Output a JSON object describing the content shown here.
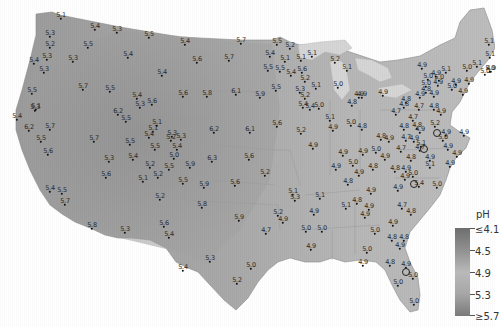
{
  "map": {
    "subject": "Precipitation pH across the contiguous United States",
    "colors": {
      "acid_low": "#6e6e6e",
      "mid": "#b9b9b9",
      "high": "#7a7a7a",
      "water": "#d0d0d0",
      "background": "#ffffff"
    }
  },
  "legend": {
    "title": "pH",
    "labels": [
      "≤4.1",
      "4.5",
      "4.9",
      "5.3",
      "≥5.7"
    ]
  },
  "stations": [
    {
      "v": "5.1",
      "x": 61,
      "y": 19
    },
    {
      "v": "5.4",
      "x": 95,
      "y": 30
    },
    {
      "v": "5.3",
      "x": 117,
      "y": 33
    },
    {
      "v": "5.5",
      "x": 149,
      "y": 38
    },
    {
      "v": "5.3",
      "x": 50,
      "y": 37
    },
    {
      "v": "5.2",
      "x": 50,
      "y": 48
    },
    {
      "v": "5.5",
      "x": 88,
      "y": 48
    },
    {
      "v": "5.3",
      "x": 47,
      "y": 60
    },
    {
      "v": "5.4",
      "x": 34,
      "y": 64
    },
    {
      "v": "5.3",
      "x": 73,
      "y": 62
    },
    {
      "v": "5.4",
      "x": 128,
      "y": 58
    },
    {
      "v": "5.3",
      "x": 44,
      "y": 73
    },
    {
      "v": "5.5",
      "x": 32,
      "y": 94
    },
    {
      "v": "5.7",
      "x": 83,
      "y": 90
    },
    {
      "v": "5.5",
      "x": 110,
      "y": 92
    },
    {
      "v": "5.1",
      "x": 36,
      "y": 110
    },
    {
      "v": "5.3",
      "x": 35,
      "y": 111
    },
    {
      "v": "5.4",
      "x": 137,
      "y": 99
    },
    {
      "v": "5.3",
      "x": 140,
      "y": 108
    },
    {
      "v": "5.6",
      "x": 152,
      "y": 105
    },
    {
      "v": "5.4",
      "x": 185,
      "y": 45
    },
    {
      "v": "5.7",
      "x": 241,
      "y": 44
    },
    {
      "v": "5.6",
      "x": 197,
      "y": 63
    },
    {
      "v": "5.7",
      "x": 229,
      "y": 61
    },
    {
      "v": "5.4",
      "x": 162,
      "y": 76
    },
    {
      "v": "5.6",
      "x": 183,
      "y": 97
    },
    {
      "v": "5.8",
      "x": 207,
      "y": 97
    },
    {
      "v": "6.1",
      "x": 236,
      "y": 95
    },
    {
      "v": "5.9",
      "x": 260,
      "y": 98
    },
    {
      "v": "5.5",
      "x": 277,
      "y": 45
    },
    {
      "v": "5.2",
      "x": 290,
      "y": 49
    },
    {
      "v": "5.4",
      "x": 270,
      "y": 57
    },
    {
      "v": "5.1",
      "x": 285,
      "y": 62
    },
    {
      "v": "5.1",
      "x": 301,
      "y": 61
    },
    {
      "v": "5.5",
      "x": 268,
      "y": 71
    },
    {
      "v": "5.5",
      "x": 280,
      "y": 72
    },
    {
      "v": "5.4",
      "x": 291,
      "y": 76
    },
    {
      "v": "5.5",
      "x": 276,
      "y": 91
    },
    {
      "v": "5.6",
      "x": 302,
      "y": 73
    },
    {
      "v": "5.2",
      "x": 305,
      "y": 82
    },
    {
      "v": "5.3",
      "x": 300,
      "y": 93
    },
    {
      "v": "5.2",
      "x": 305,
      "y": 99
    },
    {
      "v": "5.4",
      "x": 303,
      "y": 108
    },
    {
      "v": "5.1",
      "x": 312,
      "y": 57
    },
    {
      "v": "5.2",
      "x": 335,
      "y": 63
    },
    {
      "v": "5.1",
      "x": 347,
      "y": 71
    },
    {
      "v": "5.1",
      "x": 316,
      "y": 89
    },
    {
      "v": "5.0",
      "x": 338,
      "y": 88
    },
    {
      "v": "4.9",
      "x": 359,
      "y": 98
    },
    {
      "v": "5.4",
      "x": 17,
      "y": 120
    },
    {
      "v": "6.2",
      "x": 29,
      "y": 131
    },
    {
      "v": "5.7",
      "x": 50,
      "y": 130
    },
    {
      "v": "5.5",
      "x": 41,
      "y": 142
    },
    {
      "v": "5.6",
      "x": 48,
      "y": 155
    },
    {
      "v": "6.2",
      "x": 118,
      "y": 115
    },
    {
      "v": "5.5",
      "x": 126,
      "y": 122
    },
    {
      "v": "5.7",
      "x": 94,
      "y": 142
    },
    {
      "v": "5.5",
      "x": 130,
      "y": 145
    },
    {
      "v": "5.4",
      "x": 133,
      "y": 160
    },
    {
      "v": "5.3",
      "x": 109,
      "y": 162
    },
    {
      "v": "5.6",
      "x": 106,
      "y": 178
    },
    {
      "v": "5.2",
      "x": 150,
      "y": 168
    },
    {
      "v": "5.1",
      "x": 143,
      "y": 182
    },
    {
      "v": "5.1",
      "x": 153,
      "y": 132
    },
    {
      "v": "5.3",
      "x": 172,
      "y": 137
    },
    {
      "v": "5.1",
      "x": 157,
      "y": 126
    },
    {
      "v": "5.2",
      "x": 171,
      "y": 141
    },
    {
      "v": "5.3",
      "x": 181,
      "y": 140
    },
    {
      "v": "5.4",
      "x": 149,
      "y": 138
    },
    {
      "v": "5.5",
      "x": 155,
      "y": 150
    },
    {
      "v": "5.4",
      "x": 177,
      "y": 150
    },
    {
      "v": "5.0",
      "x": 174,
      "y": 159
    },
    {
      "v": "5.9",
      "x": 190,
      "y": 168
    },
    {
      "v": "5.5",
      "x": 169,
      "y": 170
    },
    {
      "v": "5.2",
      "x": 158,
      "y": 178
    },
    {
      "v": "5.5",
      "x": 183,
      "y": 184
    },
    {
      "v": "5.9",
      "x": 204,
      "y": 188
    },
    {
      "v": "6.2",
      "x": 214,
      "y": 133
    },
    {
      "v": "6.1",
      "x": 250,
      "y": 133
    },
    {
      "v": "5.6",
      "x": 277,
      "y": 127
    },
    {
      "v": "6.3",
      "x": 212,
      "y": 162
    },
    {
      "v": "5.6",
      "x": 249,
      "y": 160
    },
    {
      "v": "5.6",
      "x": 235,
      "y": 186
    },
    {
      "v": "5.2",
      "x": 265,
      "y": 176
    },
    {
      "v": "5.1",
      "x": 293,
      "y": 195
    },
    {
      "v": "5.3",
      "x": 295,
      "y": 201
    },
    {
      "v": "5.2",
      "x": 160,
      "y": 200
    },
    {
      "v": "5.8",
      "x": 202,
      "y": 208
    },
    {
      "v": "5.6",
      "x": 164,
      "y": 227
    },
    {
      "v": "5.4",
      "x": 169,
      "y": 238
    },
    {
      "v": "5.9",
      "x": 239,
      "y": 221
    },
    {
      "v": "5.4",
      "x": 50,
      "y": 192
    },
    {
      "v": "5.5",
      "x": 62,
      "y": 194
    },
    {
      "v": "5.7",
      "x": 65,
      "y": 205
    },
    {
      "v": "5.8",
      "x": 92,
      "y": 229
    },
    {
      "v": "5.3",
      "x": 125,
      "y": 233
    },
    {
      "v": "5.2",
      "x": 278,
      "y": 216
    },
    {
      "v": "4.9",
      "x": 283,
      "y": 223
    },
    {
      "v": "4.7",
      "x": 266,
      "y": 234
    },
    {
      "v": "5.3",
      "x": 210,
      "y": 262
    },
    {
      "v": "5.4",
      "x": 183,
      "y": 271
    },
    {
      "v": "5.0",
      "x": 251,
      "y": 269
    },
    {
      "v": "5.2",
      "x": 237,
      "y": 284
    },
    {
      "v": "4.9",
      "x": 362,
      "y": 98
    },
    {
      "v": "4.8",
      "x": 352,
      "y": 106
    },
    {
      "v": "5.4",
      "x": 310,
      "y": 110
    },
    {
      "v": "5.0",
      "x": 319,
      "y": 109
    },
    {
      "v": "5.1",
      "x": 330,
      "y": 121
    },
    {
      "v": "4.9",
      "x": 333,
      "y": 131
    },
    {
      "v": "5.2",
      "x": 301,
      "y": 134
    },
    {
      "v": "4.9",
      "x": 313,
      "y": 149
    },
    {
      "v": "4.8",
      "x": 362,
      "y": 130
    },
    {
      "v": "4.9",
      "x": 343,
      "y": 156
    },
    {
      "v": "5.0",
      "x": 351,
      "y": 126
    },
    {
      "v": "4.9",
      "x": 383,
      "y": 96
    },
    {
      "v": "4.8",
      "x": 406,
      "y": 103
    },
    {
      "v": "4.7",
      "x": 419,
      "y": 110
    },
    {
      "v": "4.9",
      "x": 420,
      "y": 98
    },
    {
      "v": "4.9",
      "x": 434,
      "y": 97
    },
    {
      "v": "4.8",
      "x": 426,
      "y": 93
    },
    {
      "v": "5.0",
      "x": 428,
      "y": 80
    },
    {
      "v": "5.0",
      "x": 439,
      "y": 81
    },
    {
      "v": "4.9",
      "x": 438,
      "y": 86
    },
    {
      "v": "5.0",
      "x": 452,
      "y": 90
    },
    {
      "v": "4.7",
      "x": 396,
      "y": 115
    },
    {
      "v": "4.7",
      "x": 413,
      "y": 121
    },
    {
      "v": "4.8",
      "x": 417,
      "y": 129
    },
    {
      "v": "4.9",
      "x": 420,
      "y": 133
    },
    {
      "v": "4.8",
      "x": 404,
      "y": 130
    },
    {
      "v": "4.7",
      "x": 406,
      "y": 141
    },
    {
      "v": "4.9",
      "x": 414,
      "y": 142
    },
    {
      "v": "4.8",
      "x": 434,
      "y": 110
    },
    {
      "v": "5.2",
      "x": 435,
      "y": 127
    },
    {
      "v": "4.9",
      "x": 441,
      "y": 115
    },
    {
      "v": "5.0",
      "x": 443,
      "y": 141
    },
    {
      "v": "4.9",
      "x": 446,
      "y": 136
    },
    {
      "v": "4.9",
      "x": 448,
      "y": 150
    },
    {
      "v": "4.9",
      "x": 464,
      "y": 136
    },
    {
      "v": "4.9",
      "x": 491,
      "y": 72
    },
    {
      "v": "4.9",
      "x": 463,
      "y": 95
    },
    {
      "v": "5.1",
      "x": 489,
      "y": 45
    },
    {
      "v": "5.1",
      "x": 490,
      "y": 58
    },
    {
      "v": "5.1",
      "x": 477,
      "y": 67
    },
    {
      "v": "5.0",
      "x": 467,
      "y": 71
    },
    {
      "v": "5.0",
      "x": 485,
      "y": 75
    },
    {
      "v": "5.0",
      "x": 490,
      "y": 72
    },
    {
      "v": "4.9",
      "x": 422,
      "y": 69
    },
    {
      "v": "4.9",
      "x": 436,
      "y": 77
    },
    {
      "v": "5.1",
      "x": 446,
      "y": 73
    },
    {
      "v": "5.0",
      "x": 426,
      "y": 87
    },
    {
      "v": "4.9",
      "x": 456,
      "y": 85
    },
    {
      "v": "4.9",
      "x": 469,
      "y": 84
    },
    {
      "v": "4.8",
      "x": 404,
      "y": 108
    },
    {
      "v": "4.9",
      "x": 406,
      "y": 172
    },
    {
      "v": "4.8",
      "x": 411,
      "y": 161
    },
    {
      "v": "5.1",
      "x": 421,
      "y": 147
    },
    {
      "v": "4.7",
      "x": 420,
      "y": 151
    },
    {
      "v": "4.9",
      "x": 430,
      "y": 161
    },
    {
      "v": "5.1",
      "x": 430,
      "y": 168
    },
    {
      "v": "4.9",
      "x": 450,
      "y": 167
    },
    {
      "v": "4.9",
      "x": 457,
      "y": 157
    },
    {
      "v": "5.0",
      "x": 413,
      "y": 177
    },
    {
      "v": "5.4",
      "x": 419,
      "y": 187
    },
    {
      "v": "5.0",
      "x": 437,
      "y": 188
    },
    {
      "v": "4.9",
      "x": 405,
      "y": 180
    },
    {
      "v": "4.8",
      "x": 395,
      "y": 172
    },
    {
      "v": "4.9",
      "x": 385,
      "y": 160
    },
    {
      "v": "5.0",
      "x": 376,
      "y": 153
    },
    {
      "v": "4.9",
      "x": 363,
      "y": 155
    },
    {
      "v": "4.8",
      "x": 373,
      "y": 170
    },
    {
      "v": "5.0",
      "x": 353,
      "y": 166
    },
    {
      "v": "4.9",
      "x": 359,
      "y": 176
    },
    {
      "v": "4.9",
      "x": 389,
      "y": 142
    },
    {
      "v": "4.7",
      "x": 401,
      "y": 152
    },
    {
      "v": "4.8",
      "x": 381,
      "y": 140
    },
    {
      "v": "4.9",
      "x": 336,
      "y": 170
    },
    {
      "v": "4.8",
      "x": 348,
      "y": 185
    },
    {
      "v": "4.9",
      "x": 371,
      "y": 194
    },
    {
      "v": "4.8",
      "x": 357,
      "y": 204
    },
    {
      "v": "4.9",
      "x": 369,
      "y": 210
    },
    {
      "v": "4.7",
      "x": 402,
      "y": 209
    },
    {
      "v": "4.8",
      "x": 411,
      "y": 215
    },
    {
      "v": "4.9",
      "x": 398,
      "y": 191
    },
    {
      "v": "5.1",
      "x": 320,
      "y": 199
    },
    {
      "v": "4.9",
      "x": 314,
      "y": 215
    },
    {
      "v": "5.1",
      "x": 346,
      "y": 209
    },
    {
      "v": "4.9",
      "x": 365,
      "y": 218
    },
    {
      "v": "5.0",
      "x": 306,
      "y": 232
    },
    {
      "v": "5.0",
      "x": 322,
      "y": 232
    },
    {
      "v": "4.9",
      "x": 311,
      "y": 250
    },
    {
      "v": "5.0",
      "x": 375,
      "y": 234
    },
    {
      "v": "4.9",
      "x": 393,
      "y": 226
    },
    {
      "v": "4.8",
      "x": 392,
      "y": 241
    },
    {
      "v": "4.8",
      "x": 404,
      "y": 241
    },
    {
      "v": "4.9",
      "x": 400,
      "y": 249
    },
    {
      "v": "5.0",
      "x": 367,
      "y": 253
    },
    {
      "v": "4.9",
      "x": 363,
      "y": 266
    },
    {
      "v": "4.8",
      "x": 390,
      "y": 266
    },
    {
      "v": "4.9",
      "x": 406,
      "y": 268
    },
    {
      "v": "5.0",
      "x": 413,
      "y": 279
    },
    {
      "v": "5.0",
      "x": 398,
      "y": 286
    },
    {
      "v": "5.0",
      "x": 414,
      "y": 305
    }
  ],
  "city_markers": [
    {
      "x": 437,
      "y": 133
    },
    {
      "x": 424,
      "y": 149
    },
    {
      "x": 414,
      "y": 184
    },
    {
      "x": 406,
      "y": 272
    }
  ]
}
